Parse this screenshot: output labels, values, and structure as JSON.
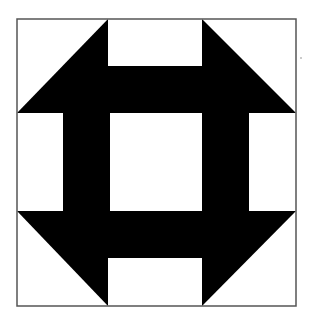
{
  "diagram": {
    "colors": {
      "background": "#ffffff",
      "fill": "#000000",
      "border": "#555555"
    },
    "frame": {
      "x": 17,
      "y": 19,
      "width": 279,
      "height": 287
    },
    "shapes": [
      {
        "name": "top-left-triangle",
        "points": "17,113 108,19 108,113"
      },
      {
        "name": "top-right-triangle",
        "points": "202,19 296,113 202,113"
      },
      {
        "name": "bottom-left-triangle",
        "points": "17,211 108,211 108,306"
      },
      {
        "name": "bottom-right-triangle",
        "points": "202,211 296,211 202,306"
      },
      {
        "name": "top-bar",
        "points": "108,66 202,66 202,113 108,113"
      },
      {
        "name": "bottom-bar",
        "points": "108,211 202,211 202,258 108,258"
      },
      {
        "name": "left-bar",
        "points": "63,113 110,113 110,211 63,211"
      },
      {
        "name": "right-bar",
        "points": "202,113 249,113 249,211 202,211"
      }
    ],
    "center_square": {
      "x": 110,
      "y": 113,
      "width": 92,
      "height": 98
    },
    "speck": {
      "cx": 301,
      "cy": 58,
      "r": 0.8
    }
  }
}
